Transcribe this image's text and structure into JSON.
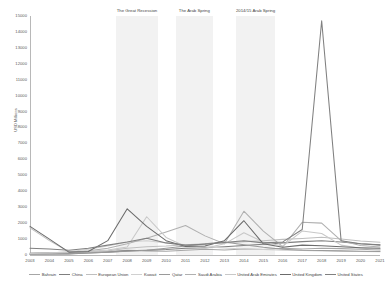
{
  "chart_data": {
    "type": "line",
    "title": "",
    "xlabel": "",
    "ylabel": "USD Millions",
    "xlim": [
      2003,
      2021
    ],
    "ylim": [
      0,
      15000
    ],
    "ytick_step": 1000,
    "grid": false,
    "legend_position": "bottom",
    "x": [
      2003,
      2004,
      2005,
      2006,
      2007,
      2008,
      2009,
      2010,
      2011,
      2012,
      2013,
      2014,
      2015,
      2016,
      2017,
      2018,
      2019,
      2020,
      2021
    ],
    "xticks": [
      "2003",
      "2004",
      "2005",
      "2006",
      "2007",
      "2008",
      "2009",
      "2010",
      "2011",
      "2012",
      "2013",
      "2014",
      "2015",
      "2016",
      "2017",
      "2018",
      "2019",
      "2020",
      "2021"
    ],
    "yticks": [
      "0",
      "1000",
      "2000",
      "3000",
      "4000",
      "5000",
      "6000",
      "7000",
      "8000",
      "9000",
      "10000",
      "11000",
      "12000",
      "13000",
      "14000",
      "15000"
    ],
    "annotations": [
      {
        "label": "The Great Recession",
        "x_start": 2007.4,
        "x_end": 2009.6
      },
      {
        "label": "The Arab Spring",
        "x_start": 2010.5,
        "x_end": 2012.4
      },
      {
        "label": "2014/15 Arab Spring",
        "x_start": 2013.6,
        "x_end": 2015.6
      }
    ],
    "band_color": "#f2f2f2",
    "series": [
      {
        "name": "Bahrain",
        "color": "#a6a6a6",
        "values": [
          120,
          160,
          140,
          180,
          220,
          300,
          260,
          240,
          300,
          360,
          320,
          380,
          340,
          420,
          380,
          430,
          400,
          360,
          320
        ]
      },
      {
        "name": "China",
        "color": "#7f7f7f",
        "values": [
          60,
          80,
          70,
          120,
          180,
          260,
          300,
          340,
          420,
          460,
          520,
          600,
          680,
          760,
          840,
          900,
          820,
          700,
          640
        ]
      },
      {
        "name": "European Union",
        "color": "#bfbfbf",
        "values": [
          1700,
          900,
          200,
          180,
          260,
          420,
          520,
          560,
          640,
          700,
          760,
          840,
          900,
          980,
          1040,
          1120,
          1000,
          880,
          800
        ]
      },
      {
        "name": "Kuwait",
        "color": "#d0d0d0",
        "values": [
          80,
          120,
          200,
          360,
          560,
          820,
          900,
          760,
          640,
          520,
          440,
          380,
          340,
          300,
          280,
          260,
          240,
          220,
          200
        ]
      },
      {
        "name": "Qatar",
        "color": "#9a9a9a",
        "values": [
          40,
          60,
          80,
          120,
          180,
          240,
          300,
          420,
          560,
          700,
          820,
          640,
          480,
          360,
          300,
          280,
          260,
          240,
          220
        ]
      },
      {
        "name": "Saudi Arabia",
        "color": "#b0b0b0",
        "values": [
          60,
          100,
          160,
          260,
          420,
          700,
          1050,
          1450,
          1850,
          1200,
          700,
          2750,
          1500,
          520,
          2050,
          2000,
          900,
          600,
          500
        ]
      },
      {
        "name": "United Arab Emirates",
        "color": "#c8c8c8",
        "values": [
          100,
          140,
          180,
          240,
          320,
          500,
          2400,
          1100,
          540,
          420,
          700,
          1400,
          820,
          560,
          1500,
          1350,
          620,
          420,
          360
        ]
      },
      {
        "name": "United Kingdom",
        "color": "#6b6b6b",
        "values": [
          1800,
          1000,
          180,
          220,
          900,
          2900,
          1800,
          900,
          540,
          560,
          900,
          2150,
          700,
          480,
          620,
          580,
          520,
          460,
          420
        ]
      },
      {
        "name": "United States",
        "color": "#808080",
        "values": [
          420,
          380,
          300,
          420,
          620,
          820,
          1050,
          760,
          620,
          680,
          780,
          900,
          760,
          820,
          1600,
          14700,
          900,
          700,
          620
        ]
      }
    ]
  }
}
